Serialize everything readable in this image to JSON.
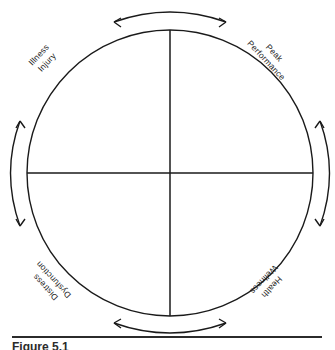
{
  "figure": {
    "caption": "Figure 5.1",
    "diagram_type": "quadrant-circle-model",
    "description_title": "Health and performance continuum circle"
  },
  "diagram": {
    "circle": {
      "center_x": 170,
      "center_y": 173,
      "radius": 143,
      "stroke_color": "#1a1a1a",
      "fill_color": "#ffffff"
    },
    "axes": {
      "vertical_label": "vertical-axis",
      "horizontal_label": "horizontal-axis",
      "stroke_color": "#1a1a1a"
    },
    "quadrant_labels": [
      {
        "id": "illness-injury",
        "position": "top-left",
        "line1": "Illness",
        "line2": "Injury",
        "rotation_deg": -47
      },
      {
        "id": "peak-performance",
        "position": "top-right",
        "line1": "Peak",
        "line2": "Performance",
        "rotation_deg": 47
      },
      {
        "id": "distress-dysfunction",
        "position": "bottom-left",
        "line1": "Distress",
        "line2": "Dysfunction",
        "rotation_deg": 227
      },
      {
        "id": "health-wellness",
        "position": "bottom-right",
        "line1": "Health",
        "line2": "Wellness",
        "rotation_deg": 133
      }
    ],
    "arrows": [
      {
        "id": "top-arrow",
        "orientation": "horizontal",
        "side": "top",
        "double_headed": true
      },
      {
        "id": "right-arrow",
        "orientation": "vertical",
        "side": "right",
        "double_headed": true
      },
      {
        "id": "bottom-arrow",
        "orientation": "horizontal",
        "side": "bottom",
        "double_headed": true
      },
      {
        "id": "left-arrow",
        "orientation": "vertical",
        "side": "left",
        "double_headed": true
      }
    ]
  }
}
